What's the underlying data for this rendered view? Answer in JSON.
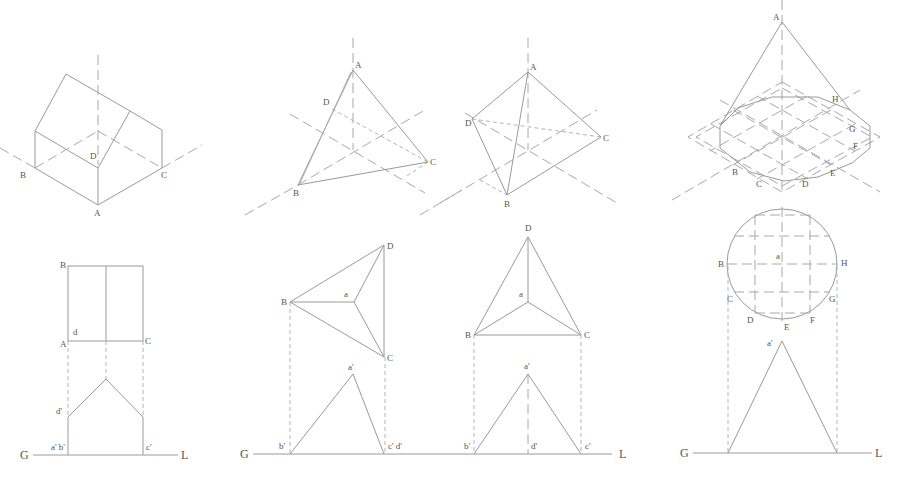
{
  "figure": {
    "colors": {
      "line": "#9a9a9a",
      "label": "#555555",
      "background": "#ffffff"
    }
  },
  "drawings": [
    {
      "name": "house-prism",
      "isometric_labels": {
        "A": "A",
        "B": "B",
        "C": "C",
        "D": "D"
      },
      "plan_labels": {
        "B": "B",
        "A": "A",
        "C": "C",
        "d": "d"
      },
      "elevation_labels": {
        "d_prime": "d'",
        "ab_prime": "a' b'",
        "c_prime": "c'"
      },
      "ground_line": {
        "G": "G",
        "L": "L"
      }
    },
    {
      "name": "tetrahedron-1",
      "isometric_labels": {
        "A": "A",
        "B": "B",
        "C": "C",
        "D": "D"
      },
      "plan_labels": {
        "D": "D",
        "B": "B",
        "C": "C",
        "a": "a"
      },
      "elevation_labels": {
        "a_prime": "a'",
        "b_prime": "b'",
        "cd_prime": "c' d'"
      },
      "ground_line": {
        "G": "G"
      }
    },
    {
      "name": "tetrahedron-2",
      "isometric_labels": {
        "A": "A",
        "B": "B",
        "C": "C",
        "D": "D"
      },
      "plan_labels": {
        "D": "D",
        "B": "B",
        "C": "C",
        "a": "a"
      },
      "elevation_labels": {
        "a_prime": "a'",
        "b_prime": "b'",
        "d_prime": "d'",
        "c_prime": "c'"
      },
      "ground_line": {
        "L": "L"
      }
    },
    {
      "name": "cone",
      "isometric_labels": {
        "A": "A",
        "B": "B",
        "C": "C",
        "D": "D",
        "E": "E",
        "F": "F",
        "G": "G",
        "H": "H"
      },
      "plan_labels": {
        "a": "a",
        "B": "B",
        "C": "C",
        "D": "D",
        "E": "E",
        "F": "F",
        "G": "G",
        "H": "H"
      },
      "elevation_labels": {
        "a_prime": "a'"
      },
      "ground_line": {
        "G": "G",
        "L": "L"
      }
    }
  ]
}
